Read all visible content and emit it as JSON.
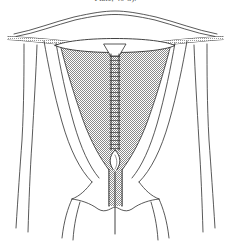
{
  "figure": {
    "caption": "Plate, 40-3).",
    "background_color": "#ffffff",
    "line_color": "#2e2e2e",
    "stipple_color": "#7d7d7d",
    "stipple_fill": "#d9d9d9",
    "parts": [
      {
        "name": "uterine-fundus-outline",
        "label": "Uterine fundus"
      },
      {
        "name": "uterine-body-outline",
        "label": "Uterine body"
      },
      {
        "name": "endometrial-cavity-shading",
        "label": "Endometrial cavity"
      },
      {
        "name": "left-fallopian-tube",
        "label": "Left fallopian tube"
      },
      {
        "name": "right-fallopian-tube",
        "label": "Right fallopian tube"
      },
      {
        "name": "left-broad-ligament",
        "label": "Left broad ligament"
      },
      {
        "name": "right-broad-ligament",
        "label": "Right broad ligament"
      },
      {
        "name": "iud-crossbar",
        "label": "IUD transverse arm"
      },
      {
        "name": "iud-coiled-stem",
        "label": "IUD coiled vertical stem"
      },
      {
        "name": "internal-os",
        "label": "Internal cervical os"
      },
      {
        "name": "cervical-canal",
        "label": "Cervical canal"
      },
      {
        "name": "cervix",
        "label": "Cervix"
      },
      {
        "name": "vaginal-fornix-left",
        "label": "Left vaginal fornix"
      },
      {
        "name": "vaginal-fornix-right",
        "label": "Right vaginal fornix"
      },
      {
        "name": "iud-string",
        "label": "IUD retrieval string"
      }
    ],
    "iud": {
      "coil_turns": 26,
      "stem_top_y": 46,
      "stem_bottom_y": 150,
      "crossbar_width": 120
    }
  }
}
